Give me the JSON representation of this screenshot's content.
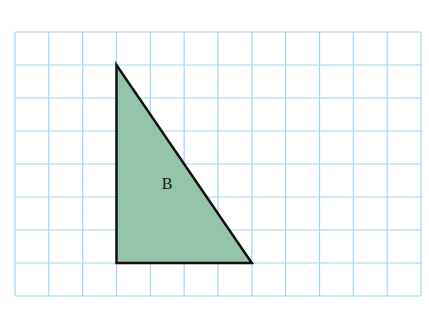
{
  "grid": {
    "columns": 12,
    "rows": 8,
    "left": 15,
    "top": 32,
    "right": 421,
    "bottom": 296,
    "line_color": "#9fd6ec",
    "background": "#ffffff"
  },
  "shapes": [
    {
      "type": "right-triangle",
      "label": "B",
      "vertices_grid": [
        [
          3,
          1
        ],
        [
          3,
          7
        ],
        [
          7,
          7
        ]
      ],
      "fill": "#94c4a9",
      "stroke": "#111111",
      "label_pos_px": [
        167,
        184
      ]
    }
  ]
}
